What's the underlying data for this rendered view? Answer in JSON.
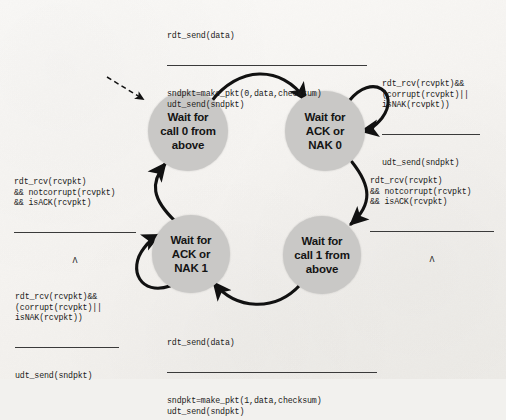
{
  "diagram": {
    "colors": {
      "state_fill": "#c9c8c6",
      "arrow": "#111111",
      "page_background": "#f4f2ef",
      "text": "#141414"
    },
    "states": [
      {
        "id": "wait-call-0",
        "label": "Wait for\ncall 0 from\nabove",
        "cx": 188,
        "cy": 131,
        "r": 40
      },
      {
        "id": "wait-ack-nak-0",
        "label": "Wait for\nACK or\nNAK 0",
        "cx": 325,
        "cy": 131,
        "r": 40
      },
      {
        "id": "wait-ack-nak-1",
        "label": "Wait for\nACK or\nNAK 1",
        "cx": 191,
        "cy": 254,
        "r": 39
      },
      {
        "id": "wait-call-1",
        "label": "Wait for\ncall 1 from\nabove",
        "cx": 322,
        "cy": 255,
        "r": 39
      }
    ],
    "transitions": [
      {
        "id": "call0-to-ack0",
        "from": "wait-call-0",
        "to": "wait-ack-nak-0",
        "condition": "rdt_send(data)",
        "action": "sndpkt=make_pkt(0,data,checksum)\nudt_send(sndpkt)"
      },
      {
        "id": "ack0-self-loop",
        "from": "wait-ack-nak-0",
        "to": "wait-ack-nak-0",
        "condition": "rdt_rcv(rcvpkt)&&\n(corrupt(rcvpkt)||\nisNAK(rcvpkt))",
        "action": "udt_send(sndpkt)"
      },
      {
        "id": "ack0-to-call1",
        "from": "wait-ack-nak-0",
        "to": "wait-call-1",
        "condition": "rdt_rcv(rcvpkt)\n&& notcorrupt(rcvpkt)\n&& isACK(rcvpkt)",
        "action": "Λ"
      },
      {
        "id": "call1-to-ack1",
        "from": "wait-call-1",
        "to": "wait-ack-nak-1",
        "condition": "rdt_send(data)",
        "action": "sndpkt=make_pkt(1,data,checksum)\nudt_send(sndpkt)"
      },
      {
        "id": "ack1-self-loop",
        "from": "wait-ack-nak-1",
        "to": "wait-ack-nak-1",
        "condition": "rdt_rcv(rcvpkt)&&\n(corrupt(rcvpkt)||\nisNAK(rcvpkt))",
        "action": "udt_send(sndpkt)"
      },
      {
        "id": "ack1-to-call0",
        "from": "wait-ack-nak-1",
        "to": "wait-call-0",
        "condition": "rdt_rcv(rcvpkt)\n&& notcorrupt(rcvpkt)\n&& isACK(rcvpkt)",
        "action": "Λ"
      }
    ],
    "start_arrow": {
      "id": "start-arrow",
      "style": "dashed",
      "target": "wait-call-0"
    }
  }
}
